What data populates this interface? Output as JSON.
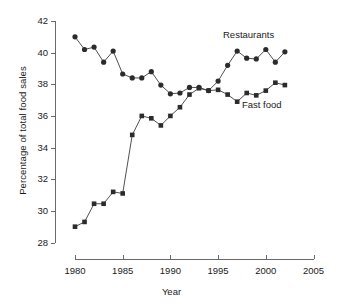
{
  "chart_data": {
    "type": "line",
    "title": "",
    "xlabel": "Year",
    "ylabel": "Percentage of total food sales",
    "xlim": [
      1980,
      2005
    ],
    "ylim": [
      28,
      42
    ],
    "xticks": [
      1980,
      1985,
      1990,
      1995,
      2000,
      2005
    ],
    "yticks": [
      28,
      30,
      32,
      34,
      36,
      38,
      40,
      42
    ],
    "grid": false,
    "legend_position": "inline-annotations",
    "x": [
      1980,
      1981,
      1982,
      1983,
      1984,
      1985,
      1986,
      1987,
      1988,
      1989,
      1990,
      1991,
      1992,
      1993,
      1994,
      1995,
      1996,
      1997,
      1998,
      1999,
      2000,
      2001,
      2002
    ],
    "series": [
      {
        "name": "Restaurants",
        "marker": "circle",
        "values": [
          41.0,
          40.2,
          40.35,
          39.4,
          40.1,
          38.65,
          38.4,
          38.4,
          38.8,
          37.95,
          37.4,
          37.45,
          37.8,
          37.8,
          37.6,
          38.2,
          39.2,
          40.1,
          39.65,
          39.6,
          40.2,
          39.4,
          40.05
        ]
      },
      {
        "name": "Fast food",
        "marker": "square",
        "values": [
          29.0,
          29.3,
          30.45,
          30.45,
          31.2,
          31.1,
          34.8,
          36.0,
          35.85,
          35.4,
          36.0,
          36.55,
          37.35,
          37.75,
          37.6,
          37.65,
          37.35,
          36.9,
          37.45,
          37.3,
          37.6,
          38.1,
          37.95
        ]
      }
    ],
    "annotations": [
      {
        "text": "Restaurants",
        "series": "Restaurants"
      },
      {
        "text": "Fast food",
        "series": "Fast food"
      }
    ],
    "colors": {
      "marker": "#2b2b2b",
      "line": "#3c3c3c",
      "axis": "#6a6a6a",
      "background": "#ffffff"
    }
  }
}
